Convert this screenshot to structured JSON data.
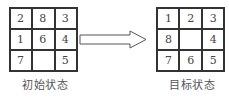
{
  "initial_state": {
    "label": "初始状态",
    "cells": [
      "2",
      "8",
      "3",
      "1",
      "6",
      "4",
      "7",
      "",
      "5"
    ]
  },
  "goal_state": {
    "label": "目标状态",
    "cells": [
      "1",
      "2",
      "3",
      "8",
      "",
      "4",
      "7",
      "6",
      "5"
    ]
  },
  "arrow": {
    "direction": "right",
    "style": "hollow"
  },
  "colors": {
    "line": "#333333",
    "text": "#444444",
    "background": "#ffffff"
  }
}
